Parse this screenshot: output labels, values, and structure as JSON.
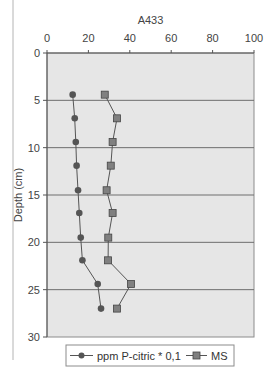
{
  "chart_data": {
    "type": "line",
    "title": "A433",
    "xlabel": "",
    "ylabel": "Depth (cm)",
    "xlim": [
      0,
      100
    ],
    "ylim": [
      0,
      30
    ],
    "y_inverted": true,
    "x_axis_position": "top",
    "x_ticks": [
      0,
      20,
      40,
      60,
      80,
      100
    ],
    "y_ticks": [
      0,
      5,
      10,
      15,
      20,
      25,
      30
    ],
    "grid": {
      "horizontal": true,
      "vertical": false
    },
    "legend_position": "bottom",
    "series": [
      {
        "name": "ppm P-citric * 0,1",
        "marker": "circle",
        "color": "#555555",
        "points": [
          {
            "x": 12.4,
            "depth": 4.4
          },
          {
            "x": 13.4,
            "depth": 6.9
          },
          {
            "x": 13.9,
            "depth": 9.4
          },
          {
            "x": 14.3,
            "depth": 11.9
          },
          {
            "x": 15.0,
            "depth": 14.5
          },
          {
            "x": 15.6,
            "depth": 16.9
          },
          {
            "x": 16.3,
            "depth": 19.5
          },
          {
            "x": 17.1,
            "depth": 21.9
          },
          {
            "x": 24.5,
            "depth": 24.4
          },
          {
            "x": 26.1,
            "depth": 27.0
          }
        ]
      },
      {
        "name": "MS",
        "marker": "square",
        "color": "#777777",
        "points": [
          {
            "x": 27.9,
            "depth": 4.4
          },
          {
            "x": 33.8,
            "depth": 6.9
          },
          {
            "x": 31.7,
            "depth": 9.4
          },
          {
            "x": 30.8,
            "depth": 11.9
          },
          {
            "x": 28.8,
            "depth": 14.5
          },
          {
            "x": 31.7,
            "depth": 16.9
          },
          {
            "x": 29.6,
            "depth": 19.5
          },
          {
            "x": 29.5,
            "depth": 21.9
          },
          {
            "x": 40.6,
            "depth": 24.4
          },
          {
            "x": 33.8,
            "depth": 27.0
          }
        ]
      }
    ]
  },
  "legend": {
    "items": [
      {
        "label": "ppm P-citric * 0,1",
        "marker": "circle"
      },
      {
        "label": "MS",
        "marker": "square"
      }
    ]
  },
  "colors": {
    "plot_background": "#e6e6e6",
    "plot_border": "#8c8c8c",
    "gridline": "#6e6e6e",
    "series_line": "#555555"
  }
}
